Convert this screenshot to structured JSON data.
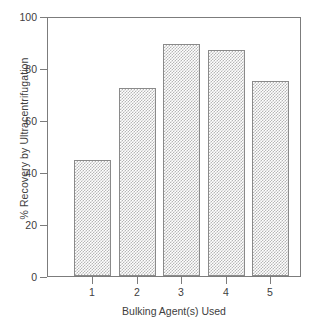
{
  "chart_data": {
    "type": "bar",
    "title": "",
    "subtitle": "",
    "xlabel": "Bulking Agent(s) Used",
    "ylabel": "% Recovery by Ultracentrifugation",
    "categories": [
      "1",
      "2",
      "3",
      "4",
      "5"
    ],
    "values": [
      45,
      73,
      90,
      87.5,
      75.5
    ],
    "series": [
      {
        "name": "% Recovery by Ultracentrifugation",
        "values": [
          45,
          73,
          90,
          87.5,
          75.5
        ]
      }
    ],
    "ylim": [
      0,
      100
    ],
    "yticks": [
      0,
      20,
      40,
      60,
      80,
      100
    ],
    "ytick_labels": [
      "0",
      "20",
      "40",
      "60",
      "80",
      "100"
    ],
    "xticks": [
      1,
      2,
      3,
      4,
      5
    ],
    "xtick_labels": [
      "1",
      "2",
      "3",
      "4",
      "5"
    ],
    "grid": false,
    "legend": false,
    "legend_position": "none",
    "bar_fill": "gray-stipple-hatch",
    "colors": {
      "bar_fill": "#b6b6b6",
      "bar_edge": "#8a8a8a",
      "axis": "#7c7c7c",
      "text": "#404040",
      "background": "#ffffff"
    }
  }
}
